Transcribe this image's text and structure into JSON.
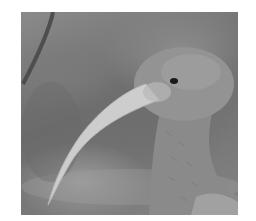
{
  "image": {
    "subject": "ibis bird head and neck in profile with long curved bill",
    "palette": {
      "background": "#7a7a7a",
      "bird_body": "#8e8e8e",
      "bill": "#cfcfcf",
      "eye": "#1a1a1a",
      "branch": "#4a4a4a",
      "page": "#ffffff"
    }
  }
}
